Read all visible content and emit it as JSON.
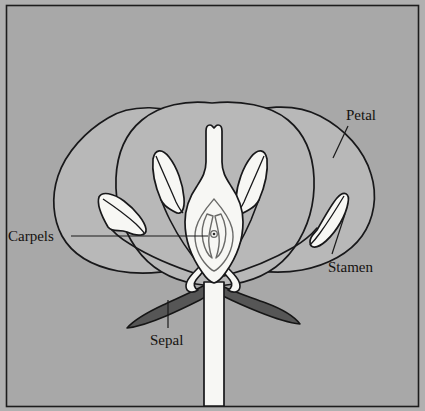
{
  "figure": {
    "background_color": "#a8a8a8",
    "frame_color": "#1a1a1a",
    "petal_fill": "#b8b8b8",
    "sepal_fill": "#555555",
    "organ_fill": "#f5f5f2",
    "outline_color": "#18181a"
  },
  "labels": {
    "petal": "Petal",
    "stamen": "Stamen",
    "carpels": "Carpels",
    "sepal": "Sepal"
  },
  "parts": {
    "petal": {
      "name": "Petal",
      "count_visible": 3
    },
    "stamen": {
      "name": "Stamen",
      "count_visible": 4
    },
    "carpels": {
      "name": "Carpels",
      "ovule_visible": 1
    },
    "sepal": {
      "name": "Sepal",
      "count_visible": 2
    },
    "style": {
      "name": "style-with-stigma"
    },
    "ovary": {
      "name": "ovary-chamber"
    },
    "pedicel": {
      "name": "pedicel-stem"
    }
  }
}
